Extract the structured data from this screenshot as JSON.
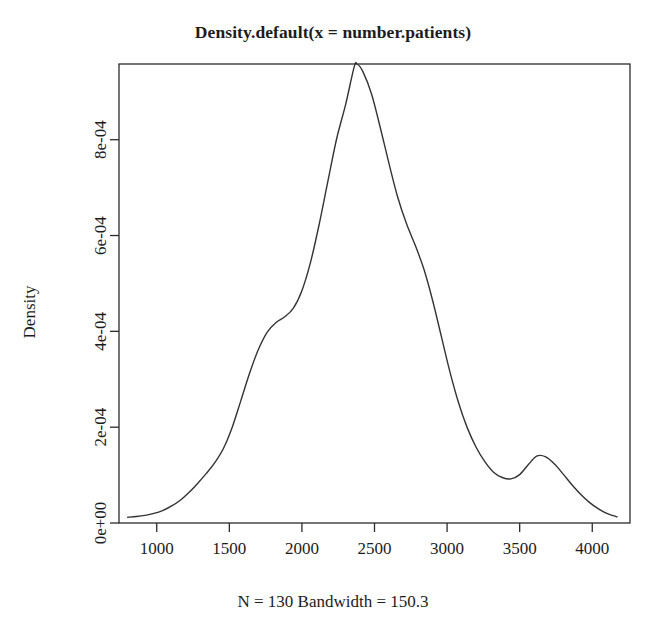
{
  "chart_data": {
    "type": "line",
    "title": "Density.default(x = number.patients)",
    "subtitle": "",
    "caption": "N = 130  Bandwidth = 150.3",
    "xlabel": "",
    "ylabel": "Density",
    "grid": false,
    "legend": "none",
    "n": 130,
    "bandwidth": 150.3,
    "xlim": [
      740,
      4260
    ],
    "ylim": [
      0,
      0.000958
    ],
    "xticks": [
      1000,
      1500,
      2000,
      2500,
      3000,
      3500,
      4000
    ],
    "xtick_labels": [
      "1000",
      "1500",
      "2000",
      "2500",
      "3000",
      "3500",
      "4000"
    ],
    "yticks": [
      0,
      0.0002,
      0.0004,
      0.0006,
      0.0008
    ],
    "ytick_labels": [
      "0e+00",
      "2e-04",
      "4e-04",
      "6e-04",
      "8e-04"
    ],
    "line_color": "#333333",
    "line_width": 1.4,
    "series": [
      {
        "name": "density",
        "x": [
          800,
          860,
          920,
          980,
          1040,
          1100,
          1160,
          1220,
          1280,
          1340,
          1400,
          1460,
          1520,
          1580,
          1640,
          1700,
          1760,
          1820,
          1880,
          1940,
          2000,
          2060,
          2120,
          2180,
          2240,
          2300,
          2360,
          2380,
          2420,
          2480,
          2540,
          2600,
          2660,
          2720,
          2780,
          2840,
          2900,
          2960,
          3020,
          3080,
          3140,
          3200,
          3260,
          3320,
          3380,
          3440,
          3500,
          3560,
          3620,
          3680,
          3740,
          3800,
          3860,
          3920,
          3980,
          4040,
          4100,
          4170
        ],
        "y": [
          1.2e-05,
          1.35e-05,
          1.6e-05,
          2e-05,
          2.6e-05,
          3.5e-05,
          4.7e-05,
          6.3e-05,
          8.2e-05,
          0.000103,
          0.000126,
          0.000156,
          0.0002,
          0.000256,
          0.000313,
          0.000362,
          0.000398,
          0.000418,
          0.00043,
          0.000448,
          0.000485,
          0.000545,
          0.000625,
          0.000715,
          0.000803,
          0.000872,
          0.000952,
          0.000958,
          0.000942,
          0.000895,
          0.000825,
          0.00075,
          0.00068,
          0.000625,
          0.00058,
          0.00053,
          0.000465,
          0.00039,
          0.000315,
          0.00025,
          0.000198,
          0.000158,
          0.000128,
          0.000106,
          9.5e-05,
          9.2e-05,
          0.000101,
          0.000122,
          0.00014,
          0.000138,
          0.000123,
          0.000102,
          8e-05,
          6e-05,
          4.3e-05,
          3e-05,
          2e-05,
          1.3e-05
        ]
      }
    ]
  },
  "axes": {
    "y_title": "Density"
  }
}
